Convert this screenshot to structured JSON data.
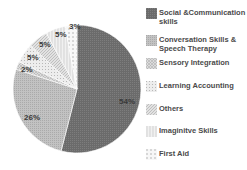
{
  "chart_data": {
    "type": "pie",
    "title": "",
    "legend_position": "right",
    "start_angle_deg": 0,
    "direction": "clockwise",
    "slices": [
      {
        "label": "Social &Communication skills",
        "value": 54,
        "display": "54%",
        "color": "#6e6e6e",
        "pattern": "dense-dots"
      },
      {
        "label": "Conversation Skills & Speech Therapy",
        "value": 26,
        "display": "26%",
        "color": "#bdbdbd",
        "pattern": "fine-dots"
      },
      {
        "label": "Sensory Integration",
        "value": 2,
        "display": "2%",
        "color": "#d6d6d6",
        "pattern": "crosshatch"
      },
      {
        "label": "Learning Accounting",
        "value": 5,
        "display": "5%",
        "color": "#e6e6e6",
        "pattern": "sparse-dots"
      },
      {
        "label": "Others",
        "value": 5,
        "display": "5%",
        "color": "#d9d9d9",
        "pattern": "diagonal"
      },
      {
        "label": "Imaginitve  Skills",
        "value": 5,
        "display": "5%",
        "color": "#ececec",
        "pattern": "vertical"
      },
      {
        "label": "First Aid",
        "value": 3,
        "display": "3%",
        "color": "#f4f4f4",
        "pattern": "dashes"
      }
    ]
  },
  "labels": {
    "s0": "54%",
    "s1": "26%",
    "s2": "2%",
    "s3": "5%",
    "s4": "5%",
    "s5": "5%",
    "s6": "3%"
  },
  "legend": [
    {
      "label_line1": "Social &Communication",
      "label_line2": "skills"
    },
    {
      "label_line1": "Conversation Skills &",
      "label_line2": "Speech Therapy"
    },
    {
      "label_line1": "Sensory Integration",
      "label_line2": ""
    },
    {
      "label_line1": "Learning Accounting",
      "label_line2": ""
    },
    {
      "label_line1": "Others",
      "label_line2": ""
    },
    {
      "label_line1": "Imaginitve  Skills",
      "label_line2": ""
    },
    {
      "label_line1": "First Aid",
      "label_line2": ""
    }
  ]
}
